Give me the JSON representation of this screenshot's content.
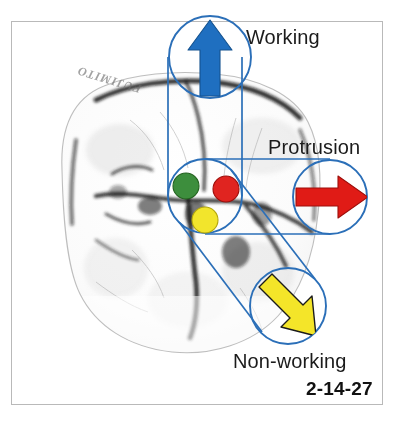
{
  "figure": {
    "number": "2-14-27",
    "specimen_ink_text": "FUJIMITO",
    "frame_color": "#b9b9b9",
    "background_color": "#ffffff"
  },
  "annotations": {
    "line_color": "#2b6fb8",
    "circle_color": "#2b6fb8",
    "working": {
      "label": "Working",
      "arrow_icon": "arrow-up-icon",
      "arrow_color": "#1f6fc0",
      "arrow_outline": "#14528f",
      "circle": {
        "cx": 210,
        "cy": 57,
        "r": 42
      }
    },
    "protrusion": {
      "label": "Protrusion",
      "arrow_icon": "arrow-right-icon",
      "arrow_color": "#e01b16",
      "arrow_outline": "#9d0f0b",
      "circle": {
        "cx": 330,
        "cy": 197,
        "r": 38
      }
    },
    "nonworking": {
      "label": "Non-working",
      "arrow_icon": "arrow-down-right-icon",
      "arrow_color": "#f4e529",
      "arrow_outline": "#1b1b1b",
      "circle": {
        "cx": 288,
        "cy": 306,
        "r": 39
      }
    },
    "center": {
      "label": "Occlusal contact cluster",
      "circle": {
        "cx": 205,
        "cy": 196,
        "r": 37
      },
      "contacts": [
        {
          "name": "green-contact-dot",
          "color": "#3d8e3d",
          "outline": "#24621f",
          "cx": 186,
          "cy": 186,
          "r": 13
        },
        {
          "name": "red-contact-dot",
          "color": "#e02420",
          "outline": "#9d0f0b",
          "cx": 226,
          "cy": 189,
          "r": 13
        },
        {
          "name": "yellow-contact-dot",
          "color": "#f2e52c",
          "outline": "#b3a60d",
          "cx": 205,
          "cy": 220,
          "r": 13
        }
      ]
    }
  },
  "specimen": {
    "name": "molar-occlusal-photograph",
    "description": "Grayscale occlusal view of a mandibular molar"
  }
}
